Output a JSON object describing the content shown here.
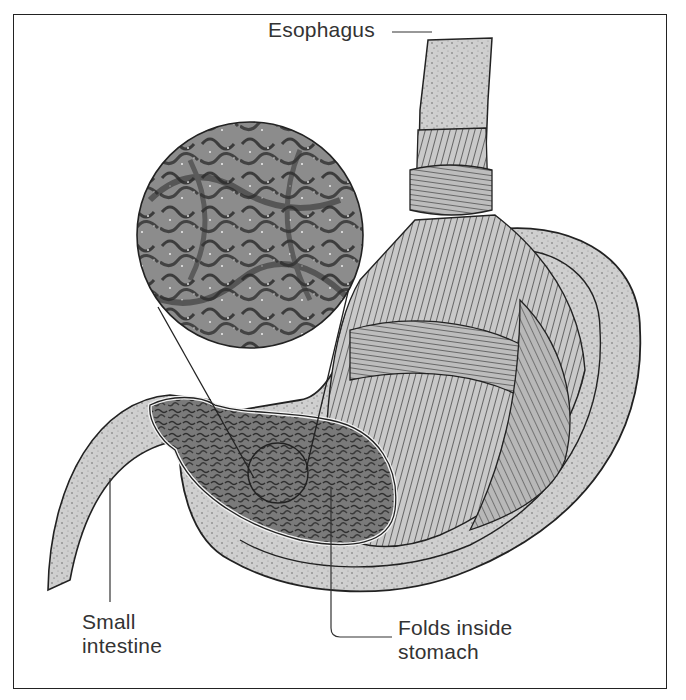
{
  "diagram": {
    "labels": {
      "esophagus": "Esophagus",
      "small_intestine_line1": "Small",
      "small_intestine_line2": "intestine",
      "folds_line1": "Folds inside",
      "folds_line2": "stomach"
    },
    "colors": {
      "ink": "#222222",
      "label_text": "#333333",
      "tissue_light": "#d9d9d9",
      "tissue_mid": "#a8a8a8",
      "tissue_dark": "#5a5a5a",
      "background": "#ffffff"
    }
  }
}
